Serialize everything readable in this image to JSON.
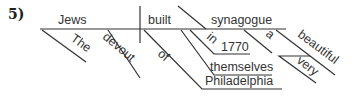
{
  "diagram": {
    "number": "5)",
    "subject": "Jews",
    "verb": "built",
    "object": "synagogue",
    "modifiers": {
      "the": "The",
      "devout": "devout",
      "of": "of",
      "philadelphia": "Philadelphia",
      "in": "in",
      "year": "1770",
      "themselves": "themselves",
      "a": "a",
      "beautiful": "beautiful",
      "very": "very"
    }
  }
}
